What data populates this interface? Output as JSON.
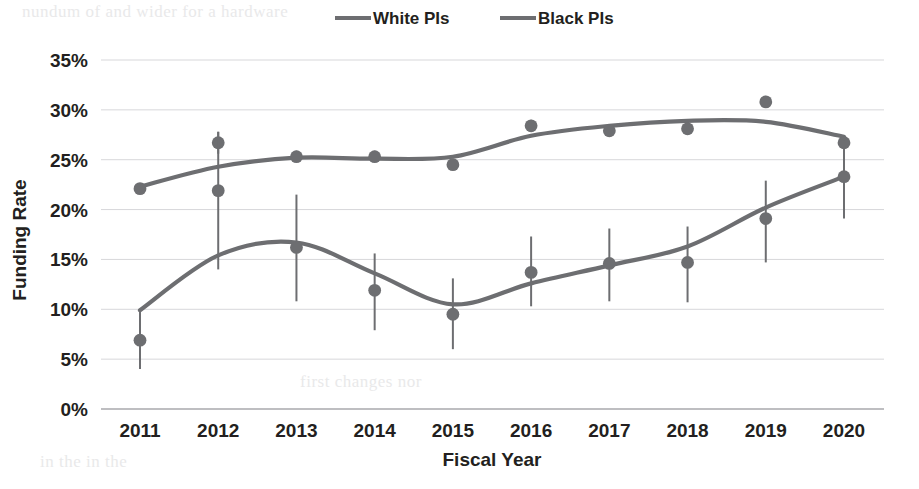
{
  "chart_data": {
    "type": "line",
    "title": "",
    "xlabel": "Fiscal Year",
    "ylabel": "Funding Rate",
    "categories": [
      "2011",
      "2012",
      "2013",
      "2014",
      "2015",
      "2016",
      "2017",
      "2018",
      "2019",
      "2020"
    ],
    "ylim": [
      0,
      35
    ],
    "ytick_labels": [
      "0%",
      "5%",
      "10%",
      "15%",
      "20%",
      "25%",
      "30%",
      "35%"
    ],
    "ytick_values": [
      0,
      5,
      10,
      15,
      20,
      25,
      30,
      35
    ],
    "grid": true,
    "legend_position": "top-center",
    "units": "percent",
    "series": [
      {
        "name": "White PIs",
        "color": "#6d6e71",
        "values": [
          22.1,
          26.7,
          25.3,
          25.3,
          24.5,
          28.4,
          27.9,
          28.1,
          30.8,
          26.7
        ],
        "error_low": [
          21.6,
          25.6,
          24.8,
          24.8,
          24.0,
          27.8,
          27.3,
          27.5,
          30.2,
          26.1
        ],
        "error_high": [
          22.6,
          27.8,
          25.9,
          25.9,
          25.1,
          29.0,
          28.5,
          28.7,
          31.4,
          27.3
        ],
        "trend": [
          22.3,
          24.3,
          25.2,
          25.1,
          25.3,
          27.4,
          28.4,
          28.9,
          28.8,
          27.3
        ]
      },
      {
        "name": "Black PIs",
        "color": "#6d6e71",
        "values": [
          6.9,
          21.9,
          16.2,
          11.9,
          9.5,
          13.7,
          14.6,
          14.7,
          19.1,
          23.3
        ],
        "error_low": [
          4.0,
          14.0,
          10.8,
          7.9,
          6.0,
          10.3,
          10.8,
          10.7,
          14.7,
          19.1
        ],
        "error_high": [
          10.0,
          27.8,
          21.5,
          15.6,
          13.1,
          17.3,
          18.1,
          18.3,
          22.9,
          26.9
        ],
        "trend": [
          9.9,
          15.4,
          16.7,
          13.6,
          10.5,
          12.6,
          14.4,
          16.3,
          20.2,
          23.3
        ]
      }
    ]
  },
  "legend": {
    "items": [
      {
        "label": "White PIs"
      },
      {
        "label": "Black PIs"
      }
    ]
  },
  "axes": {
    "x_title": "Fiscal Year",
    "y_title": "Funding Rate"
  },
  "ghost_text": {
    "line1": "nundum of and wider for a hardware",
    "line2": "in the in the",
    "line3": "first changes nor",
    "line4": "sino",
    "line5": "Fig. 2. NIH funding"
  },
  "colors": {
    "series": "#6d6e71",
    "grid": "#d7d7da",
    "text": "#231f20",
    "background": "#ffffff"
  }
}
